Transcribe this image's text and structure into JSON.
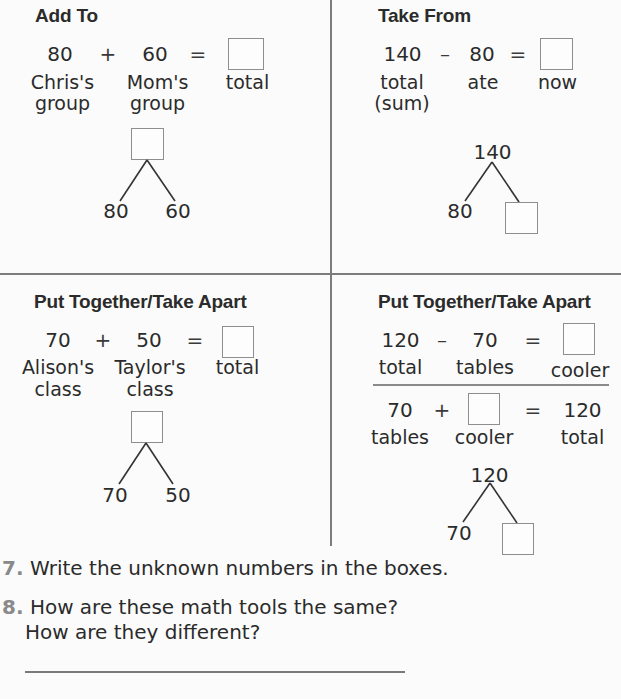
{
  "quadrants": {
    "add_to": {
      "title": "Add To",
      "equation": {
        "a": "80",
        "op1": "+",
        "b": "60",
        "op2": "=",
        "result": ""
      },
      "labels": {
        "a": "Chris's\ngroup",
        "a1": "Chris's",
        "a2": "group",
        "b1": "Mom's",
        "b2": "group",
        "result": "total"
      },
      "math_mountain": {
        "top": "",
        "left": "80",
        "right": "60"
      }
    },
    "take_from": {
      "title": "Take From",
      "equation": {
        "a": "140",
        "op1": "–",
        "b": "80",
        "op2": "=",
        "result": ""
      },
      "labels": {
        "a1": "total",
        "a2": "(sum)",
        "b": "ate",
        "result": "now"
      },
      "math_mountain": {
        "top": "140",
        "left": "80",
        "right": ""
      }
    },
    "put_together_left": {
      "title": "Put Together/Take Apart",
      "equation": {
        "a": "70",
        "op1": "+",
        "b": "50",
        "op2": "=",
        "result": ""
      },
      "labels": {
        "a1": "Alison's",
        "a2": "class",
        "b1": "Taylor's",
        "b2": "class",
        "result": "total"
      },
      "math_mountain": {
        "top": "",
        "left": "70",
        "right": "50"
      }
    },
    "put_together_right": {
      "title": "Put Together/Take Apart",
      "equation1": {
        "a": "120",
        "op1": "–",
        "b": "70",
        "op2": "=",
        "result": ""
      },
      "labels1": {
        "a": "total",
        "b": "tables",
        "result": "cooler"
      },
      "equation2": {
        "a": "70",
        "op1": "+",
        "b": "",
        "op2": "=",
        "result": "120"
      },
      "labels2": {
        "a": "tables",
        "b": "cooler",
        "result": "total"
      },
      "math_mountain": {
        "top": "120",
        "left": "70",
        "right": ""
      }
    }
  },
  "questions": [
    {
      "number": "7.",
      "text": "Write the unknown numbers in the boxes."
    },
    {
      "number": "8.",
      "text": "How are these math tools the same?",
      "text2": "How are they different?",
      "answer": ""
    }
  ],
  "colors": {
    "text": "#2b2b2b",
    "divider": "#7c7c7c",
    "box_border": "#8e8e8e",
    "question_number": "#8a8a8a"
  }
}
